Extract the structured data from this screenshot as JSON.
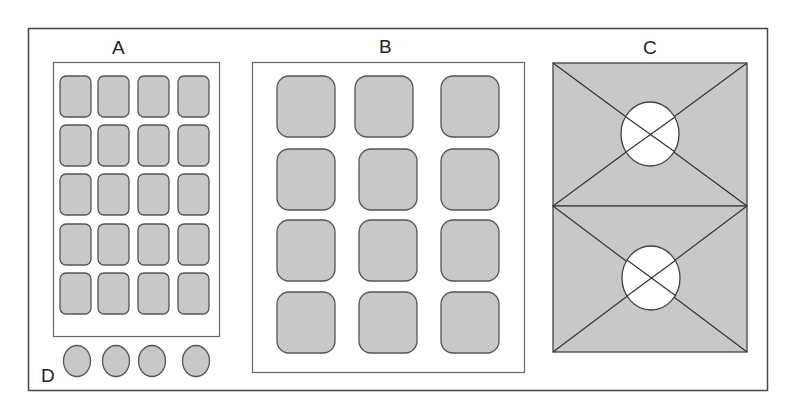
{
  "colors": {
    "fill": "#c8c8c8",
    "stroke": "#555555",
    "frame": "#444444",
    "background": "#ffffff",
    "circle_fill": "#ffffff"
  },
  "labels": {
    "a": "A",
    "b": "B",
    "c": "C",
    "d": "D"
  },
  "panels": {
    "a": {
      "label": "A",
      "type": "grid",
      "rows": 5,
      "cols": 4,
      "cell_shape": "rounded-rectangle"
    },
    "b": {
      "label": "B",
      "type": "grid",
      "rows": 4,
      "cols": 3,
      "cell_shape": "rounded-square"
    },
    "c": {
      "label": "C",
      "type": "image-placeholders",
      "count": 2,
      "description": "two stacked rectangles with diagonal crosses and central white circles"
    },
    "d": {
      "label": "D",
      "type": "circle-row",
      "count": 4
    }
  }
}
